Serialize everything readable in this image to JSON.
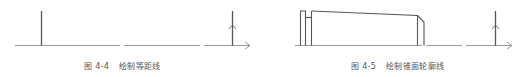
{
  "figures": [
    {
      "id": "4-4",
      "caption_label": "图 4-4",
      "caption_title": "绘制等距线",
      "elements": {
        "axis": "horizontal-centerline-with-arrow",
        "lines": [
          "vertical-line-left",
          "vertical-line-right-with-up-arrow"
        ]
      }
    },
    {
      "id": "4-5",
      "caption_label": "图 4-5",
      "caption_title": "绘制锥面轮廓线",
      "elements": {
        "axis": "horizontal-centerline-with-arrow",
        "profile": "stepped-tapered-shaft-profile",
        "lines": [
          "vertical-line-right-with-up-arrow"
        ]
      }
    }
  ],
  "colors": {
    "line": "#555555",
    "axis": "#999999",
    "caption": "#555555"
  }
}
